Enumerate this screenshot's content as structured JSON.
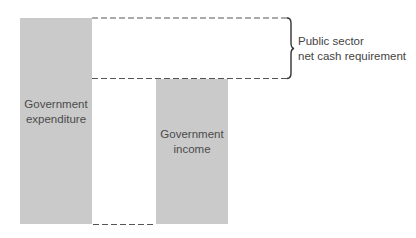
{
  "diagram": {
    "bars": [
      {
        "id": "expenditure",
        "label_line1": "Government",
        "label_line2": "expenditure",
        "color": "#cacaca"
      },
      {
        "id": "income",
        "label_line1": "Government",
        "label_line2": "income",
        "color": "#cacaca"
      }
    ],
    "brace": {
      "label_line1": "Public sector",
      "label_line2": "net cash requirement"
    },
    "line_color": "#555555"
  }
}
